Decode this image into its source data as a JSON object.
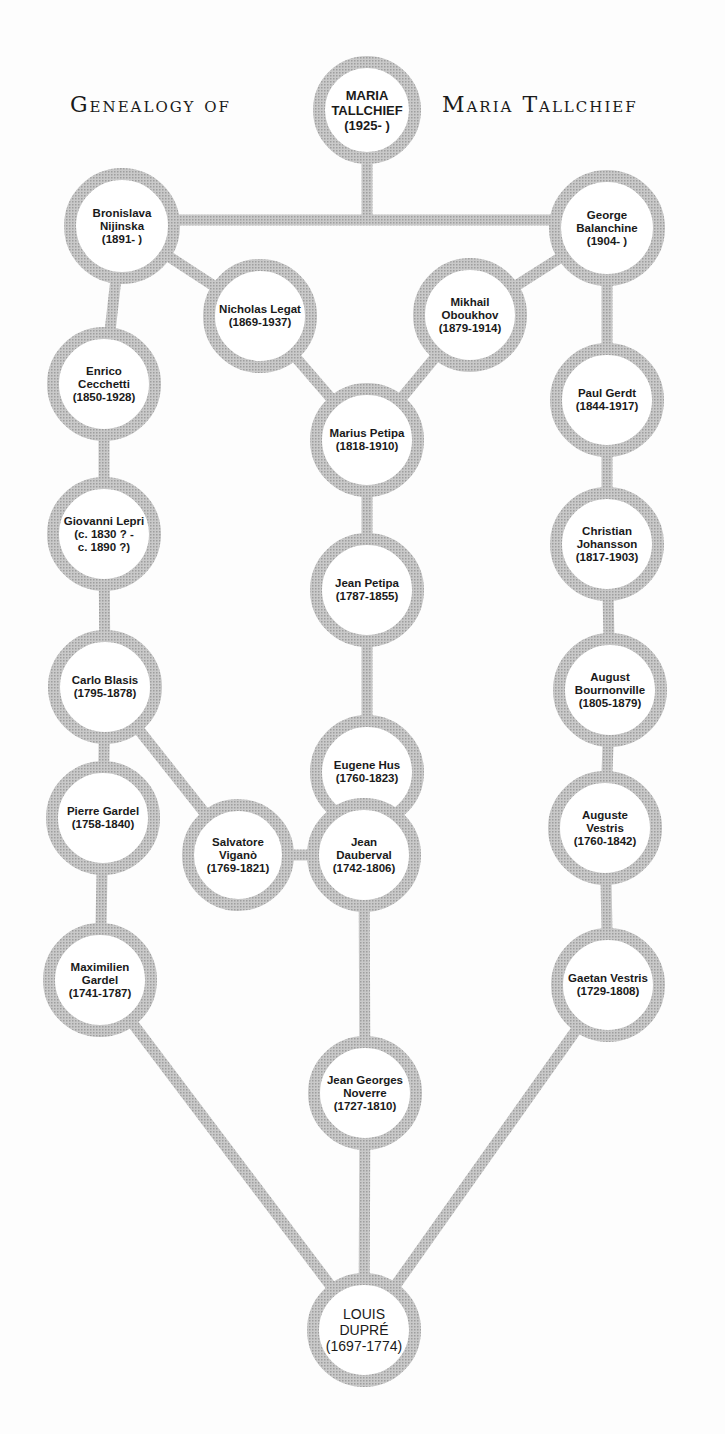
{
  "title": {
    "left": "Genealogy of",
    "right": "Maria Tallchief"
  },
  "colors": {
    "background": "#fdfdfd",
    "ring": "#b8b8b8",
    "text": "#1a1a1a"
  },
  "nodes": [
    {
      "id": "maria",
      "name": "MARIA\nTALLCHIEF",
      "dates": "(1925-      )",
      "x": 367,
      "y": 110,
      "r": 54
    },
    {
      "id": "bronislava",
      "name": "Bronislava\nNijinska",
      "dates": "(1891-        )",
      "x": 122,
      "y": 226,
      "r": 58
    },
    {
      "id": "george",
      "name": "George\nBalanchine",
      "dates": "(1904-        )",
      "x": 607,
      "y": 228,
      "r": 58
    },
    {
      "id": "nicholas",
      "name": "Nicholas Legat",
      "dates": "(1869-1937)",
      "x": 260,
      "y": 316,
      "r": 57
    },
    {
      "id": "mikhail",
      "name": "Mikhail\nOboukhov",
      "dates": "(1879-1914)",
      "x": 470,
      "y": 315,
      "r": 57
    },
    {
      "id": "enrico",
      "name": "Enrico\nCecchetti",
      "dates": "(1850-1928)",
      "x": 104,
      "y": 384,
      "r": 57
    },
    {
      "id": "marius",
      "name": "Marius Petipa",
      "dates": "(1818-1910)",
      "x": 367,
      "y": 440,
      "r": 57
    },
    {
      "id": "paul",
      "name": "Paul Gerdt",
      "dates": "(1844-1917)",
      "x": 607,
      "y": 400,
      "r": 57
    },
    {
      "id": "giovanni",
      "name": "Giovanni Lepri",
      "dates": "(c. 1830 ? -\nc. 1890 ?)",
      "x": 104,
      "y": 534,
      "r": 57
    },
    {
      "id": "christian",
      "name": "Christian\nJohansson",
      "dates": "(1817-1903)",
      "x": 607,
      "y": 544,
      "r": 57
    },
    {
      "id": "jean_petipa",
      "name": "Jean Petipa",
      "dates": "(1787-1855)",
      "x": 367,
      "y": 590,
      "r": 57
    },
    {
      "id": "carlo",
      "name": "Carlo Blasis",
      "dates": "(1795-1878)",
      "x": 105,
      "y": 687,
      "r": 57
    },
    {
      "id": "august_b",
      "name": "August\nBournonville",
      "dates": "(1805-1879)",
      "x": 610,
      "y": 690,
      "r": 57
    },
    {
      "id": "eugene",
      "name": "Eugene Hus",
      "dates": "(1760-1823)",
      "x": 367,
      "y": 772,
      "r": 57
    },
    {
      "id": "pierre",
      "name": "Pierre Gardel",
      "dates": "(1758-1840)",
      "x": 103,
      "y": 818,
      "r": 57
    },
    {
      "id": "salvatore",
      "name": "Salvatore\nViganò",
      "dates": "(1769-1821)",
      "x": 238,
      "y": 855,
      "r": 56
    },
    {
      "id": "dauberval",
      "name": "Jean\nDauberval",
      "dates": "(1742-1806)",
      "x": 364,
      "y": 855,
      "r": 57
    },
    {
      "id": "auguste_v",
      "name": "Auguste\nVestris",
      "dates": "(1760-1842)",
      "x": 605,
      "y": 828,
      "r": 57
    },
    {
      "id": "maximilien",
      "name": "Maximilien\nGardel",
      "dates": "(1741-1787)",
      "x": 100,
      "y": 980,
      "r": 57
    },
    {
      "id": "gaetan",
      "name": "Gaetan Vestris",
      "dates": "(1729-1808)",
      "x": 608,
      "y": 985,
      "r": 57
    },
    {
      "id": "noverre",
      "name": "Jean Georges\nNoverre",
      "dates": "(1727-1810)",
      "x": 365,
      "y": 1093,
      "r": 57
    },
    {
      "id": "louis",
      "name": "LOUIS\nDUPRÉ",
      "dates": "(1697-1774)",
      "x": 364,
      "y": 1330,
      "r": 57
    }
  ],
  "edges": [
    {
      "type": "path",
      "d": "M367 164 L367 220 M122 220 L607 220"
    },
    {
      "from": "bronislava",
      "to": "nicholas"
    },
    {
      "from": "george",
      "to": "mikhail"
    },
    {
      "from": "bronislava",
      "to": "enrico"
    },
    {
      "from": "george",
      "to": "paul"
    },
    {
      "from": "nicholas",
      "to": "marius"
    },
    {
      "from": "mikhail",
      "to": "marius"
    },
    {
      "from": "enrico",
      "to": "giovanni"
    },
    {
      "from": "paul",
      "to": "christian"
    },
    {
      "from": "marius",
      "to": "jean_petipa"
    },
    {
      "from": "giovanni",
      "to": "carlo"
    },
    {
      "from": "christian",
      "to": "august_b"
    },
    {
      "from": "jean_petipa",
      "to": "eugene"
    },
    {
      "from": "carlo",
      "to": "pierre"
    },
    {
      "from": "carlo",
      "to": "salvatore"
    },
    {
      "from": "august_b",
      "to": "auguste_v"
    },
    {
      "from": "eugene",
      "to": "dauberval"
    },
    {
      "from": "salvatore",
      "to": "dauberval"
    },
    {
      "from": "pierre",
      "to": "maximilien"
    },
    {
      "from": "auguste_v",
      "to": "gaetan"
    },
    {
      "from": "dauberval",
      "to": "noverre"
    },
    {
      "from": "maximilien",
      "to": "louis"
    },
    {
      "from": "noverre",
      "to": "louis"
    },
    {
      "from": "gaetan",
      "to": "louis"
    }
  ]
}
